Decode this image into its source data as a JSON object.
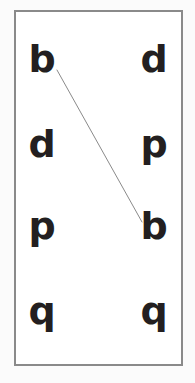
{
  "canvas": {
    "width": 195,
    "height": 383,
    "background_color": "#fbfbfb"
  },
  "frame": {
    "border_color": "#8a8a8a",
    "border_width": 2,
    "fill_color": "#ffffff",
    "x": 14,
    "y": 10,
    "width": 169,
    "height": 356
  },
  "style": {
    "letter_color": "#231f20",
    "letter_font_size": 38,
    "line_color": "#8a8a8a",
    "line_width": 1
  },
  "letters": [
    {
      "id": "row1-left",
      "text": "b",
      "x": 42,
      "y": 78,
      "row": 1,
      "column": "left"
    },
    {
      "id": "row1-right",
      "text": "d",
      "x": 154,
      "y": 78,
      "row": 1,
      "column": "right"
    },
    {
      "id": "row2-left",
      "text": "d",
      "x": 42,
      "y": 163,
      "row": 2,
      "column": "left"
    },
    {
      "id": "row2-right",
      "text": "p",
      "x": 154,
      "y": 163,
      "row": 2,
      "column": "right"
    },
    {
      "id": "row3-left",
      "text": "p",
      "x": 42,
      "y": 245,
      "row": 3,
      "column": "left"
    },
    {
      "id": "row3-right",
      "text": "b",
      "x": 154,
      "y": 245,
      "row": 3,
      "column": "right"
    },
    {
      "id": "row4-left",
      "text": "q",
      "x": 42,
      "y": 330,
      "row": 4,
      "column": "left"
    },
    {
      "id": "row4-right",
      "text": "q",
      "x": 154,
      "y": 330,
      "row": 4,
      "column": "right"
    }
  ],
  "connector": {
    "from_letter": "b",
    "to_letter": "b",
    "x1": 57,
    "y1": 70,
    "x2": 142,
    "y2": 222,
    "color": "#8a8a8a",
    "width": 1
  }
}
